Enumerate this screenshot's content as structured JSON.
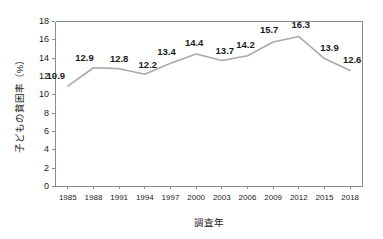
{
  "chart_data": {
    "type": "line",
    "title": "",
    "xlabel": "調査年",
    "ylabel": "子どもの貧困率（%）",
    "categories": [
      "1985",
      "1988",
      "1991",
      "1994",
      "1997",
      "2000",
      "2003",
      "2006",
      "2009",
      "2012",
      "2015",
      "2018"
    ],
    "values": [
      10.9,
      12.9,
      12.8,
      12.2,
      13.4,
      14.4,
      13.7,
      14.2,
      15.7,
      16.3,
      13.9,
      12.6
    ],
    "point_labels": [
      "10.9",
      "12.9",
      "12.8",
      "12.2",
      "13.4",
      "14.4",
      "13.7",
      "14.2",
      "15.7",
      "16.3",
      "13.9",
      "12.6"
    ],
    "ylim": [
      0,
      18
    ],
    "yticks": [
      0,
      2,
      4,
      6,
      8,
      10,
      12,
      14,
      16,
      18
    ],
    "ytick_labels": [
      "0",
      "2",
      "4",
      "6",
      "8",
      "10",
      "12",
      "14",
      "16",
      "18"
    ],
    "grid": false,
    "legend": false,
    "legend_position": "none",
    "series_name": "子どもの貧困率",
    "colors": {
      "line": "#aaaaaa",
      "axis": "#8c8c8c",
      "text": "#1a1a1a",
      "background": "#ffffff"
    }
  },
  "plot_geometry": {
    "left": 55,
    "right": 363,
    "top": 21,
    "bottom": 186
  }
}
